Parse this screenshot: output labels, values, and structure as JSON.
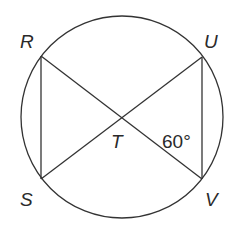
{
  "figure": {
    "type": "circle-with-inscribed-chords",
    "stroke_color": "#333333",
    "background": "#ffffff",
    "circle": {
      "cx": 122,
      "cy": 117,
      "r": 101
    },
    "points": {
      "R": {
        "label": "R",
        "x": 41,
        "y": 56
      },
      "U": {
        "label": "U",
        "x": 202,
        "y": 57
      },
      "S": {
        "label": "S",
        "x": 41,
        "y": 179
      },
      "V": {
        "label": "V",
        "x": 202,
        "y": 179
      },
      "T": {
        "label": "T",
        "x": 122,
        "y": 118
      }
    },
    "segments": [
      "RS",
      "UV",
      "RV",
      "SU"
    ],
    "angle_label": "60°"
  }
}
